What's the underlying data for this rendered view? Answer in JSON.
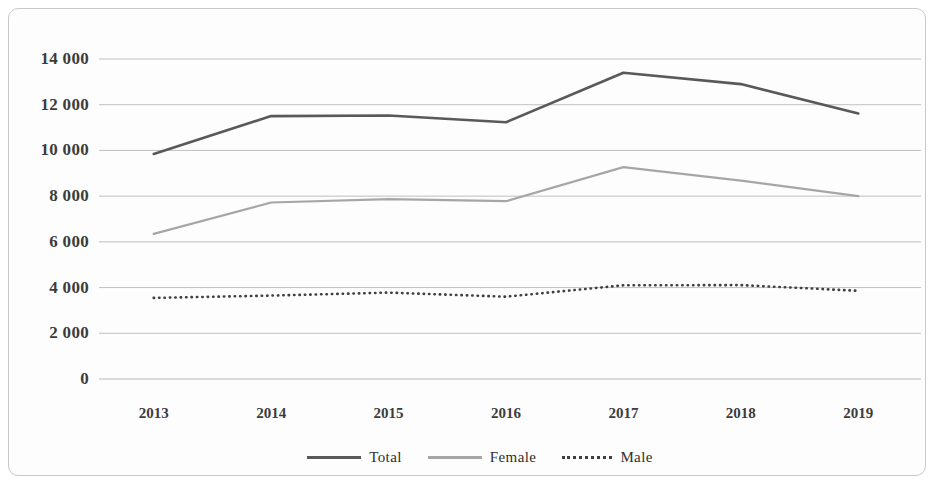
{
  "chart_data": {
    "type": "line",
    "title": "",
    "subtitle": "",
    "xlabel": "",
    "ylabel": "",
    "categories": [
      "2013",
      "2014",
      "2015",
      "2016",
      "2017",
      "2018",
      "2019"
    ],
    "series": [
      {
        "name": "Total",
        "color": "#595959",
        "style": "solid",
        "values": [
          9850,
          11500,
          11530,
          11230,
          13400,
          12900,
          11620
        ]
      },
      {
        "name": "Female",
        "color": "#a6a6a6",
        "style": "solid",
        "values": [
          6350,
          7720,
          7870,
          7780,
          9270,
          8680,
          8000
        ]
      },
      {
        "name": "Male",
        "color": "#404040",
        "style": "dotted",
        "values": [
          3550,
          3650,
          3780,
          3600,
          4100,
          4110,
          3860
        ]
      }
    ],
    "y_ticks": [
      "0",
      "2 000",
      "4 000",
      "6 000",
      "8 000",
      "10 000",
      "12 000",
      "14 000"
    ],
    "y_tick_values": [
      0,
      2000,
      4000,
      6000,
      8000,
      10000,
      12000,
      14000
    ],
    "ylim": [
      0,
      14000
    ],
    "grid": true,
    "grid_color": "#b9b9b9",
    "legend_position": "bottom",
    "legend": [
      "Total",
      "Female",
      "Male"
    ],
    "background": "#fdfdfd",
    "border_color": "#c9c9c9"
  }
}
